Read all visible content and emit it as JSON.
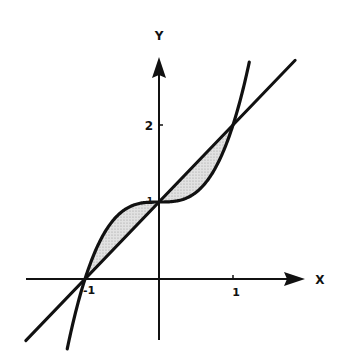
{
  "figure": {
    "type": "region-between-curves",
    "curve_label": "y = x^3 + 1",
    "line_label": "y = x + 1",
    "intersections": [
      [
        -1,
        0
      ],
      [
        0,
        1
      ],
      [
        1,
        2
      ]
    ],
    "shaded_regions": [
      "between curve and line for -1 <= x <= 0",
      "between line and curve for 0 <= x <= 1"
    ]
  },
  "axes": {
    "x_label": "X",
    "y_label": "Y",
    "x_ticks": [
      {
        "value": -1,
        "label": "-1"
      },
      {
        "value": 1,
        "label": "1"
      }
    ],
    "y_ticks": [
      {
        "value": 1,
        "label": "1"
      },
      {
        "value": 2,
        "label": "2"
      }
    ]
  },
  "colors": {
    "stroke": "#111111",
    "shade": "#d4d4d4",
    "background": "#ffffff"
  }
}
